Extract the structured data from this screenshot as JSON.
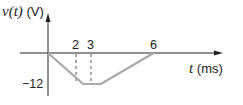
{
  "chart_data": {
    "type": "line",
    "title": "",
    "ylabel": "v(t) (V)",
    "ylabel_var": "v(t)",
    "ylabel_unit": "(V)",
    "xlabel": "t (ms)",
    "xlabel_var": "t",
    "xlabel_unit": "(ms)",
    "x": [
      0,
      2,
      3,
      6
    ],
    "series": [
      {
        "name": "v(t)",
        "values": [
          0,
          -12,
          -12,
          0
        ],
        "color": "#aaaaaa"
      }
    ],
    "x_tick_labels": [
      "2",
      "3",
      "6"
    ],
    "y_tick_labels": [
      "-12"
    ],
    "dashed_guides_at_x": [
      2,
      3
    ],
    "grid": false,
    "legend": "none"
  }
}
